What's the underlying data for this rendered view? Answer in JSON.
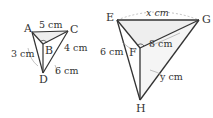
{
  "figure_left": {
    "vertices": {
      "A": "A",
      "B": "B",
      "C": "C",
      "D": "D"
    },
    "lengths": {
      "AC": "5 cm",
      "AD": "3 cm",
      "CD": "4 cm",
      "BD": "6 cm"
    }
  },
  "figure_right": {
    "vertices": {
      "E": "E",
      "F": "F",
      "G": "G",
      "H": "H"
    },
    "lengths": {
      "EG": "x cm",
      "EF": "6 cm",
      "FG": "8 cm",
      "GH": "y cm"
    }
  },
  "colors": {
    "line": "#333333",
    "dashed": "#999999",
    "shade": "#eeeeee"
  }
}
